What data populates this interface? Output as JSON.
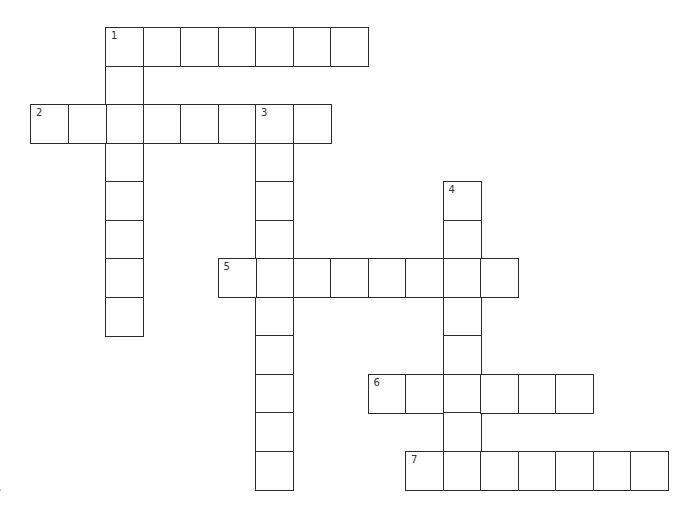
{
  "puzzle": {
    "type": "crossword",
    "cell_size": 37.5,
    "grid_origin": {
      "x": 30,
      "y": 27
    },
    "col_width": 37.5,
    "row_height": 38.5,
    "border_color": "#2b2b2b",
    "background": "#ffffff"
  },
  "entries": [
    {
      "number": "1",
      "direction": "across",
      "row": 0,
      "col": 2,
      "length": 7
    },
    {
      "number": "1",
      "direction": "down",
      "row": 0,
      "col": 2,
      "length": 8
    },
    {
      "number": "2",
      "direction": "across",
      "row": 2,
      "col": 0,
      "length": 8
    },
    {
      "number": "3",
      "direction": "down",
      "row": 2,
      "col": 6,
      "length": 10
    },
    {
      "number": "4",
      "direction": "down",
      "row": 4,
      "col": 11,
      "length": 8
    },
    {
      "number": "5",
      "direction": "across",
      "row": 6,
      "col": 5,
      "length": 8
    },
    {
      "number": "6",
      "direction": "across",
      "row": 9,
      "col": 9,
      "length": 6
    },
    {
      "number": "7",
      "direction": "across",
      "row": 11,
      "col": 10,
      "length": 7
    }
  ],
  "numbered_cells": [
    {
      "label": "1",
      "row": 0,
      "col": 2
    },
    {
      "label": "2",
      "row": 2,
      "col": 0
    },
    {
      "label": "3",
      "row": 2,
      "col": 6
    },
    {
      "label": "4",
      "row": 4,
      "col": 11
    },
    {
      "label": "5",
      "row": 6,
      "col": 5
    },
    {
      "label": "6",
      "row": 9,
      "col": 9
    },
    {
      "label": "7",
      "row": 11,
      "col": 10
    }
  ],
  "watermark": {
    "text": "✎"
  }
}
